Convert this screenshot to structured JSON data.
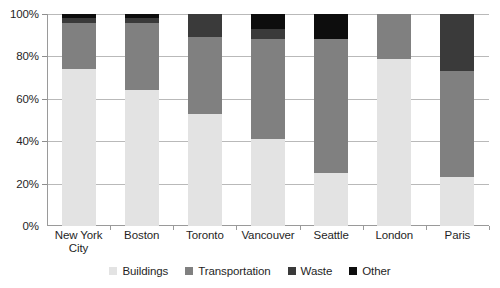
{
  "chart_data": {
    "type": "bar",
    "subtype": "stacked-100-percent",
    "title": "",
    "xlabel": "",
    "ylabel": "",
    "ylim": [
      0,
      100
    ],
    "y_unit": "%",
    "grid": true,
    "legend_position": "bottom",
    "categories": [
      "New York City",
      "Boston",
      "Toronto",
      "Vancouver",
      "Seattle",
      "London",
      "Paris"
    ],
    "ytick_labels": [
      "0%",
      "20%",
      "40%",
      "60%",
      "80%",
      "100%"
    ],
    "ytick_values": [
      0,
      20,
      40,
      60,
      80,
      100
    ],
    "series": [
      {
        "name": "Buildings",
        "color": "#e3e3e3",
        "values": [
          74,
          64,
          53,
          41,
          25,
          79,
          23
        ]
      },
      {
        "name": "Transportation",
        "color": "#808080",
        "values": [
          22,
          32,
          36,
          47,
          63,
          21,
          50
        ]
      },
      {
        "name": "Waste",
        "color": "#3a3a3a",
        "values": [
          2,
          2,
          11,
          5,
          0,
          0,
          27
        ]
      },
      {
        "name": "Other",
        "color": "#0d0d0d",
        "values": [
          2,
          2,
          0,
          7,
          12,
          0,
          0
        ]
      }
    ]
  }
}
